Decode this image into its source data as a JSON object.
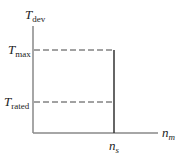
{
  "diagram": {
    "y_axis": {
      "label_main": "T",
      "label_sub": "dev"
    },
    "x_axis": {
      "label_main": "n",
      "label_sub": "m"
    },
    "levels": [
      {
        "label_main": "T",
        "label_sub": "max"
      },
      {
        "label_main": "T",
        "label_sub": "rated"
      }
    ],
    "x_marker": {
      "label_main": "n",
      "label_sub": "s"
    },
    "colors": {
      "axis": "#777777",
      "curve": "#333333",
      "dash": "#444444"
    }
  }
}
